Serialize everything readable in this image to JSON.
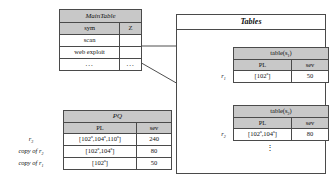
{
  "main_table": {
    "title": "MainTable",
    "columns": [
      "sym",
      "Z"
    ],
    "rows": [
      {
        "sym": "scan",
        "z": ""
      },
      {
        "sym": "web exploit",
        "z": ""
      },
      {
        "sym": "...",
        "z": "..."
      }
    ]
  },
  "pq_table": {
    "title": "PQ",
    "columns": [
      "PL",
      "sev"
    ],
    "rows": [
      {
        "label": "r",
        "label_sub": "3",
        "pl": "[102  ,104  ,110  ]",
        "pl_sup": "a",
        "sev": "240"
      },
      {
        "label": "copy of r",
        "label_sub": "2",
        "pl": "[102  ,104  ]",
        "pl_sup": "a",
        "sev": "80"
      },
      {
        "label": "copy of r",
        "label_sub": "1",
        "pl": "[102  ]",
        "pl_sup": "a",
        "sev": "50"
      }
    ]
  },
  "tables_box": {
    "title": "Tables",
    "subtables": [
      {
        "title": "table(s",
        "title_sub": "1",
        "title_end": ")",
        "columns": [
          "PL",
          "sev"
        ],
        "row_label": "r",
        "row_label_sub": "1",
        "pl": "[102  ]",
        "pl_sup": "a",
        "sev": "50"
      },
      {
        "title": "table(s",
        "title_sub": "2",
        "title_end": ")",
        "columns": [
          "PL",
          "sev"
        ],
        "row_label": "r",
        "row_label_sub": "2",
        "pl": "[102  ,104  ]",
        "pl_sup": "a",
        "sev": "80"
      }
    ],
    "ellipsis": "⋮"
  },
  "colors": {
    "header_fill": "#c8c8c8",
    "border": "#4a4a4a",
    "background": "#ffffff",
    "text": "#111111"
  }
}
